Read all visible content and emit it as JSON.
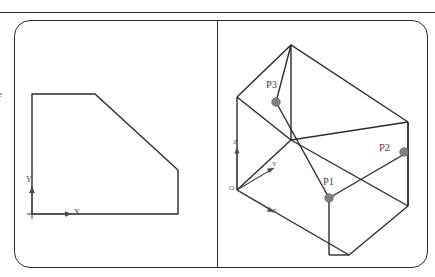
{
  "figure": {
    "kind": "engineering-drawing",
    "panels": 2,
    "frame_style": "rounded-rectangle",
    "line_color": "#2b2b2b",
    "vertex_color": "#808080",
    "background": "#ffffff",
    "top_rule": true
  },
  "left_panel": {
    "name": "orthographic-front-view",
    "shape_description": "chamfered rectangle outline",
    "axes": {
      "x_label": "X",
      "y_label": "Y",
      "origin_label": ""
    }
  },
  "right_panel": {
    "name": "isometric-pictorial-view",
    "axes": {
      "origin_label": "O",
      "x_label": "X",
      "y_label": "Y",
      "z_label": "Z"
    },
    "points": [
      {
        "label": "P1",
        "dot_x": 329,
        "dot_y": 198,
        "text_x": 329,
        "text_y": 183
      },
      {
        "label": "P2",
        "dot_x": 404,
        "dot_y": 152,
        "text_x": 382,
        "text_y": 149
      },
      {
        "label": "P3",
        "dot_x": 276,
        "dot_y": 102,
        "text_x": 268,
        "text_y": 86
      }
    ]
  },
  "edge_fragment": {
    "left_margin_glyph": "e"
  }
}
